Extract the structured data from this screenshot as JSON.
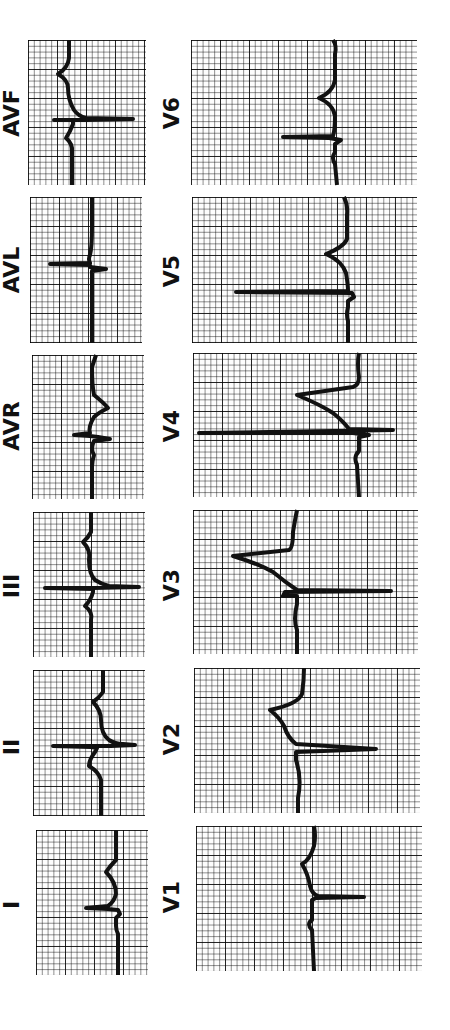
{
  "figure": {
    "type": "12-lead ECG strips (rotated 90°)",
    "limb_leads": [
      {
        "label": "AVF",
        "position": "left-1"
      },
      {
        "label": "AVL",
        "position": "left-2"
      },
      {
        "label": "AVR",
        "position": "left-3"
      },
      {
        "label": "III",
        "position": "left-4"
      },
      {
        "label": "II",
        "position": "left-5"
      },
      {
        "label": "I",
        "position": "left-6"
      }
    ],
    "precordial_leads": [
      {
        "label": "V6",
        "position": "right-1"
      },
      {
        "label": "V5",
        "position": "right-2"
      },
      {
        "label": "V4",
        "position": "right-3"
      },
      {
        "label": "V3",
        "position": "right-4"
      },
      {
        "label": "V2",
        "position": "right-5"
      },
      {
        "label": "V1",
        "position": "right-6"
      }
    ],
    "colors": {
      "grid": "#000000",
      "trace": "#111111",
      "background": "#ffffff"
    }
  }
}
